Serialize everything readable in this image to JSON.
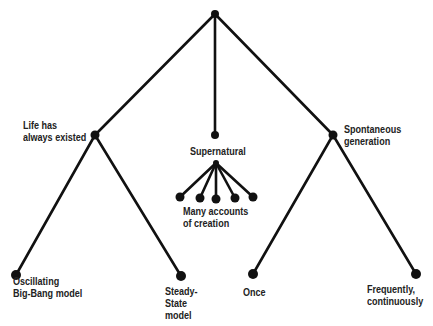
{
  "diagram": {
    "type": "tree",
    "colors": {
      "line": "#111111",
      "node": "#111111",
      "text": "#222222",
      "background": "#ffffff"
    },
    "root": {
      "id": "root",
      "x": 215,
      "y": 14
    },
    "branches": [
      {
        "id": "life",
        "label": "Life has\nalways existed",
        "x": 95,
        "y": 135
      },
      {
        "id": "supernatural",
        "label": "Supernatural",
        "x": 215,
        "y": 135
      },
      {
        "id": "spontaneous",
        "label": "Spontaneous\ngeneration",
        "x": 333,
        "y": 135
      }
    ],
    "leaves": [
      {
        "id": "oscillating",
        "parent": "life",
        "label": "Oscillating\nBig-Bang model",
        "x": 16,
        "y": 275
      },
      {
        "id": "steady",
        "parent": "life",
        "label": "Steady-\nState\nmodel",
        "x": 181,
        "y": 276
      },
      {
        "id": "creation",
        "parent": "supernatural",
        "label": "Many accounts\nof creation"
      },
      {
        "id": "once",
        "parent": "spontaneous",
        "label": "Once",
        "x": 253,
        "y": 274
      },
      {
        "id": "frequently",
        "parent": "spontaneous",
        "label": "Frequently,\ncontinuously",
        "x": 416,
        "y": 274
      }
    ],
    "fan": {
      "source": {
        "x": 216,
        "y": 163
      },
      "points": [
        {
          "x": 180,
          "y": 197
        },
        {
          "x": 200,
          "y": 198
        },
        {
          "x": 216,
          "y": 199
        },
        {
          "x": 235,
          "y": 198
        },
        {
          "x": 253,
          "y": 197
        }
      ]
    }
  },
  "labels": {
    "life": "Life has\nalways existed",
    "supernatural": "Supernatural",
    "spontaneous": "Spontaneous\ngeneration",
    "creation": "Many accounts\nof creation",
    "oscillating": "Oscillating\nBig-Bang model",
    "steady": "Steady-\nState\nmodel",
    "once": "Once",
    "frequently": "Frequently,\ncontinuously"
  }
}
